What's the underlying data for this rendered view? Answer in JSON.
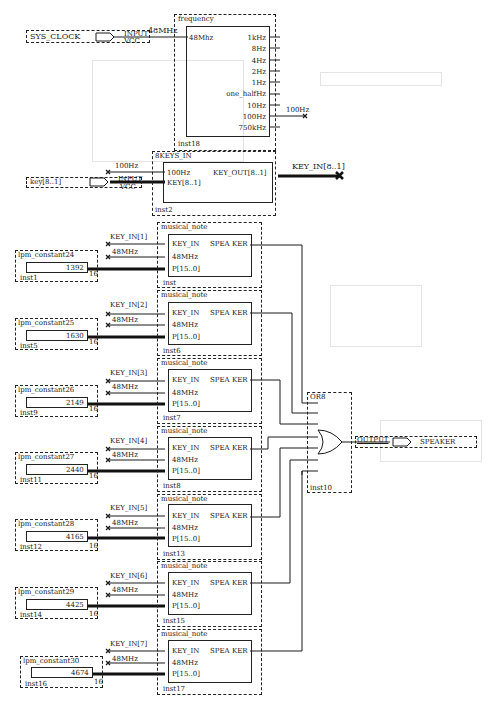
{
  "sys_clock": {
    "name": "SYS_CLOCK",
    "type": "INPUT",
    "default": "VCC",
    "net": "48MHz"
  },
  "frequency": {
    "title": "frequency",
    "input": "48Mhz",
    "outputs": [
      "1kHz",
      "8Hz",
      "4Hz",
      "2Hz",
      "1Hz",
      "one_halfHz",
      "10Hz",
      "100Hz",
      "750kHz"
    ],
    "out_net": "100Hz",
    "inst": "inst18"
  },
  "keys_in": {
    "title": "8KEYS_IN",
    "in_clk": "100Hz",
    "in_key": "KEY[8..1]",
    "out": "KEY_OUT[8..1]",
    "out_net": "KEY_IN[8..1]",
    "clk_net": "100Hz",
    "inst": "inst2"
  },
  "key_input": {
    "name": "key[8..1]",
    "type": "INPUT",
    "default": "VCC"
  },
  "notes": [
    {
      "title": "musical_note",
      "key_net": "KEY_IN[1]",
      "clk_net": "48MHz",
      "port_key": "KEY_IN",
      "port_clk": "48MHz",
      "port_p": "P[15..0]",
      "out": "SPEA KER",
      "inst": "inst",
      "const_title": "lpm_constant24",
      "const_value": "1392",
      "const_width": "16",
      "const_inst": "inst1"
    },
    {
      "title": "musical_note",
      "key_net": "KEY_IN[2]",
      "clk_net": "48MHz",
      "port_key": "KEY_IN",
      "port_clk": "48MHz",
      "port_p": "P[15..0]",
      "out": "SPEA KER",
      "inst": "inst6",
      "const_title": "lpm_constant25",
      "const_value": "1630",
      "const_width": "16",
      "const_inst": "inst5"
    },
    {
      "title": "musical_note",
      "key_net": "KEY_IN[3]",
      "clk_net": "48MHz",
      "port_key": "KEY_IN",
      "port_clk": "48MHz",
      "port_p": "P[15..0]",
      "out": "SPEA KER",
      "inst": "inst7",
      "const_title": "lpm_constant26",
      "const_value": "2149",
      "const_width": "16",
      "const_inst": "inst9"
    },
    {
      "title": "musical_note",
      "key_net": "KEY_IN[4]",
      "clk_net": "48MHz",
      "port_key": "KEY_IN",
      "port_clk": "48MHz",
      "port_p": "P[15..0]",
      "out": "SPEA KER",
      "inst": "inst8",
      "const_title": "lpm_constant27",
      "const_value": "2440",
      "const_width": "16",
      "const_inst": "inst11"
    },
    {
      "title": "musical_note",
      "key_net": "KEY_IN[5]",
      "clk_net": "48MHz",
      "port_key": "KEY_IN",
      "port_clk": "48MHz",
      "port_p": "P[15..0]",
      "out": "SPEA KER",
      "inst": "inst13",
      "const_title": "lpm_constant28",
      "const_value": "4165",
      "const_width": "16",
      "const_inst": "inst12"
    },
    {
      "title": "musical_note",
      "key_net": "KEY_IN[6]",
      "clk_net": "48MHz",
      "port_key": "KEY_IN",
      "port_clk": "48MHz",
      "port_p": "P[15..0]",
      "out": "SPEA KER",
      "inst": "inst15",
      "const_title": "lpm_constant29",
      "const_value": "4425",
      "const_width": "16",
      "const_inst": "inst14"
    },
    {
      "title": "musical_note",
      "key_net": "KEY_IN[7]",
      "clk_net": "48MHz",
      "port_key": "KEY_IN",
      "port_clk": "48MHz",
      "port_p": "P[15..0]",
      "out": "SPEA KER",
      "inst": "inst17",
      "const_title": "lpm_constant30",
      "const_value": "4674",
      "const_width": "16",
      "const_inst": "inst16"
    }
  ],
  "or_gate": {
    "title": "OR8",
    "inst": "inst10"
  },
  "output_pin": {
    "type": "OUTPUT",
    "name": "SPEAKER"
  }
}
